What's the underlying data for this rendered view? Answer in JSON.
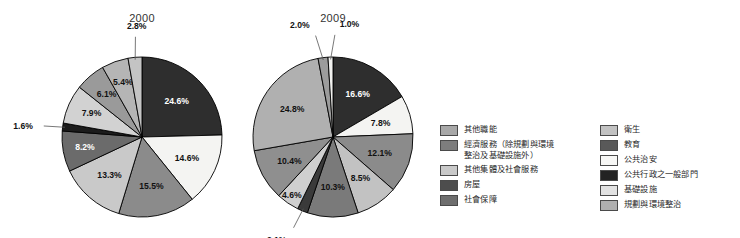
{
  "chart_data": [
    {
      "type": "pie",
      "title": "2000",
      "labels": [
        "公共行政之一般部門",
        "公共治安",
        "教育",
        "衛生",
        "社會保障",
        "房屋",
        "其他集體及社會服務",
        "經濟服務（除規劃與環境整治及基礎設施外）",
        "基礎設施",
        "規劃與環境整治"
      ],
      "values": [
        24.6,
        14.6,
        15.5,
        13.3,
        8.2,
        1.6,
        7.9,
        6.1,
        5.4,
        2.8
      ],
      "value_labels": [
        "24.6%",
        "14.6%",
        "15.5%",
        "13.3%",
        "8.2%",
        "1.6%",
        "7.9%",
        "6.1%",
        "5.4%",
        "2.8%"
      ],
      "colors": [
        "#2e2e2e",
        "#f4f4f2",
        "#8b8b8b",
        "#c9c9c9",
        "#6b6b6b",
        "#1c1c1c",
        "#d2d2d2",
        "#9a9a9a",
        "#b5b5b5",
        "#c4c4c4"
      ],
      "start_angle_deg": 0,
      "direction": "clockwise",
      "legend": "right"
    },
    {
      "type": "pie",
      "title": "2009",
      "labels": [
        "公共行政之一般部門",
        "公共治安",
        "教育",
        "衛生",
        "社會保障",
        "房屋",
        "其他集體及社會服務",
        "經濟服務（除規劃與環境整治及基礎設施外）",
        "其他職能",
        "基礎設施",
        "規劃與環境整治"
      ],
      "values": [
        16.6,
        7.8,
        12.1,
        8.5,
        10.3,
        2.1,
        4.6,
        10.4,
        24.8,
        2.0,
        1.0
      ],
      "value_labels": [
        "16.6%",
        "7.8%",
        "12.1%",
        "8.5%",
        "10.3%",
        "2.1%",
        "4.6%",
        "10.4%",
        "24.8%",
        "2.0%",
        "1.0%"
      ],
      "colors": [
        "#2e2e2e",
        "#f4f4f2",
        "#8b8b8b",
        "#c2c2c2",
        "#7a7a7a",
        "#3a3a3a",
        "#cfcfcf",
        "#8f8f8f",
        "#b0b0b0",
        "#9c9c9c",
        "#f0f0ee"
      ],
      "start_angle_deg": 0,
      "direction": "clockwise",
      "legend": "right"
    }
  ],
  "titles": {
    "left": "2000",
    "right": "2009"
  },
  "legend": {
    "column_left": [
      {
        "label": "其他職能",
        "color": "#a8a8a8"
      },
      {
        "label": "經濟服務（除規劃與環境\n整治及基礎設施外）",
        "color": "#7d7d7d"
      },
      {
        "label": "其他集體及社會服務",
        "color": "#c9c9c9"
      },
      {
        "label": "房屋",
        "color": "#4d4d4d"
      },
      {
        "label": "社會保障",
        "color": "#6e6e6e"
      }
    ],
    "column_right": [
      {
        "label": "衛生",
        "color": "#c2c2c2"
      },
      {
        "label": "教育",
        "color": "#595959"
      },
      {
        "label": "公共治安",
        "color": "#f7f7f5"
      },
      {
        "label": "公共行政之一般部門",
        "color": "#232323"
      },
      {
        "label": "基礎設施",
        "color": "#e2e2e2"
      },
      {
        "label": "規劃與環境整治",
        "color": "#b0b0b0"
      }
    ]
  }
}
